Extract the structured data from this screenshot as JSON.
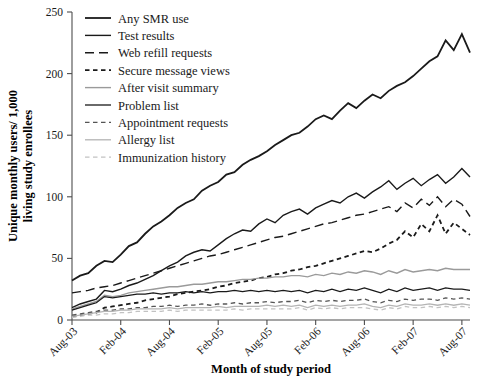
{
  "chart_data": {
    "type": "line",
    "title": "",
    "xlabel": "Month of study period",
    "ylabel": "Unique monthly users/ 1,000 living study enrollees",
    "ylim": [
      0,
      250
    ],
    "yticks": [
      0,
      50,
      100,
      150,
      200,
      250
    ],
    "ytick_labels": [
      "0",
      "50",
      "100",
      "150",
      "200",
      "250"
    ],
    "xtick_labels": [
      "Aug-03",
      "Feb-04",
      "Aug-04",
      "Feb-05",
      "Aug-05",
      "Feb-06",
      "Aug-06",
      "Feb-07",
      "Aug-07"
    ],
    "x_tick_step_months": 6,
    "x_count": 50,
    "grid": false,
    "legend_position": "top-left",
    "series": [
      {
        "name": "Any SMR use",
        "style": "solid",
        "color": "#1a1a1a",
        "width": 1.8,
        "values": [
          32,
          36,
          38,
          44,
          48,
          47,
          53,
          60,
          63,
          70,
          76,
          80,
          85,
          91,
          95,
          98,
          105,
          109,
          112,
          118,
          120,
          126,
          130,
          133,
          137,
          142,
          146,
          150,
          152,
          157,
          163,
          166,
          163,
          170,
          176,
          172,
          178,
          183,
          180,
          186,
          190,
          193,
          198,
          204,
          210,
          214,
          227,
          219,
          232,
          217
        ]
      },
      {
        "name": "Test results",
        "style": "solid",
        "color": "#1a1a1a",
        "width": 1.4,
        "values": [
          10,
          13,
          15,
          17,
          24,
          23,
          25,
          28,
          30,
          33,
          36,
          40,
          44,
          47,
          52,
          55,
          57,
          56,
          61,
          66,
          70,
          73,
          72,
          78,
          82,
          79,
          85,
          88,
          90,
          86,
          91,
          94,
          97,
          95,
          100,
          103,
          99,
          104,
          108,
          113,
          106,
          111,
          115,
          109,
          114,
          118,
          111,
          116,
          123,
          116
        ]
      },
      {
        "name": "Web refill requests",
        "style": "long-dash",
        "color": "#1a1a1a",
        "width": 1.4,
        "values": [
          22,
          23,
          24,
          26,
          27,
          28,
          30,
          32,
          34,
          36,
          38,
          40,
          42,
          44,
          46,
          48,
          50,
          52,
          53,
          55,
          57,
          59,
          61,
          63,
          65,
          67,
          68,
          70,
          72,
          74,
          76,
          78,
          79,
          81,
          83,
          85,
          86,
          88,
          90,
          92,
          88,
          95,
          91,
          98,
          93,
          100,
          92,
          98,
          94,
          84
        ]
      },
      {
        "name": "Secure message views",
        "style": "short-dash",
        "color": "#1a1a1a",
        "width": 1.8,
        "values": [
          3,
          4,
          5,
          6,
          10,
          11,
          12,
          13,
          14,
          16,
          17,
          18,
          19,
          21,
          22,
          23,
          24,
          25,
          27,
          28,
          30,
          31,
          32,
          34,
          35,
          37,
          38,
          40,
          41,
          43,
          44,
          46,
          48,
          50,
          52,
          54,
          56,
          55,
          58,
          62,
          65,
          72,
          67,
          78,
          72,
          85,
          70,
          79,
          74,
          69
        ]
      },
      {
        "name": "After visit summary",
        "style": "solid",
        "color": "#9a9a9a",
        "width": 1.4,
        "values": [
          9,
          11,
          13,
          15,
          20,
          19,
          20,
          22,
          23,
          24,
          25,
          26,
          27,
          27,
          28,
          29,
          29,
          30,
          31,
          31,
          32,
          33,
          33,
          34,
          34,
          35,
          35,
          36,
          36,
          35,
          37,
          36,
          38,
          37,
          39,
          38,
          40,
          39,
          37,
          40,
          38,
          41,
          39,
          40,
          41,
          40,
          42,
          41,
          41,
          41
        ]
      },
      {
        "name": "Problem list",
        "style": "solid",
        "color": "#1a1a1a",
        "width": 1.3,
        "values": [
          8,
          10,
          12,
          14,
          19,
          18,
          19,
          20,
          21,
          21,
          22,
          21,
          22,
          22,
          23,
          22,
          23,
          22,
          23,
          23,
          24,
          23,
          24,
          23,
          24,
          23,
          24,
          23,
          24,
          22,
          24,
          23,
          25,
          23,
          25,
          24,
          26,
          24,
          22,
          25,
          23,
          26,
          24,
          25,
          26,
          24,
          26,
          25,
          25,
          24
        ]
      },
      {
        "name": "Appointment requests",
        "style": "short-dash",
        "color": "#555555",
        "width": 1.3,
        "values": [
          4,
          5,
          6,
          7,
          8,
          8,
          9,
          9,
          10,
          10,
          11,
          11,
          12,
          11,
          12,
          12,
          13,
          12,
          13,
          13,
          14,
          13,
          14,
          14,
          15,
          14,
          15,
          15,
          16,
          14,
          16,
          15,
          16,
          15,
          16,
          16,
          17,
          15,
          14,
          16,
          15,
          17,
          16,
          17,
          17,
          16,
          18,
          17,
          18,
          17
        ]
      },
      {
        "name": "Allergy list",
        "style": "solid",
        "color": "#b4b4b4",
        "width": 1.3,
        "values": [
          3,
          4,
          5,
          6,
          7,
          7,
          8,
          8,
          9,
          9,
          9,
          9,
          10,
          9,
          10,
          10,
          10,
          10,
          11,
          10,
          11,
          11,
          11,
          11,
          12,
          11,
          12,
          11,
          12,
          10,
          12,
          11,
          12,
          11,
          12,
          12,
          13,
          11,
          10,
          12,
          11,
          13,
          12,
          12,
          13,
          12,
          13,
          12,
          13,
          12
        ]
      },
      {
        "name": "Immunization history",
        "style": "short-dash",
        "color": "#c2c2c2",
        "width": 1.3,
        "values": [
          2,
          3,
          4,
          4,
          5,
          5,
          6,
          6,
          7,
          7,
          7,
          7,
          8,
          7,
          8,
          8,
          8,
          8,
          8,
          8,
          9,
          8,
          9,
          9,
          9,
          9,
          9,
          9,
          10,
          8,
          10,
          9,
          10,
          9,
          10,
          10,
          10,
          9,
          8,
          10,
          9,
          11,
          10,
          10,
          11,
          10,
          11,
          10,
          11,
          10
        ]
      }
    ]
  },
  "legend": {
    "items": [
      {
        "label": "Any SMR use"
      },
      {
        "label": "Test results"
      },
      {
        "label": "Web refill requests"
      },
      {
        "label": "Secure message views"
      },
      {
        "label": "After visit summary"
      },
      {
        "label": "Problem list"
      },
      {
        "label": "Appointment requests"
      },
      {
        "label": "Allergy list"
      },
      {
        "label": "Immunization history"
      }
    ]
  },
  "axes": {
    "x_title": "Month of study period",
    "y_title_line1": "Unique monthly users/ 1,000",
    "y_title_line2": "living study enrollees"
  }
}
